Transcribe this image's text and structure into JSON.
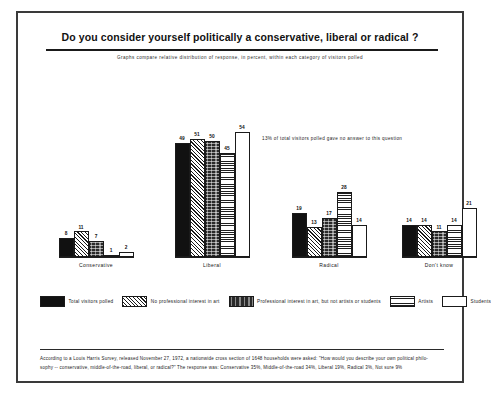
{
  "header": {
    "title": "Do you consider yourself politically a conservative, liberal or radical ?",
    "subtitle": "Graphs compare relative distribution of response, in percent, within each category of visitors polled"
  },
  "note": "13% of total visitors polled gave no answer to this question",
  "legend": {
    "items": [
      {
        "label": "Total visitors polled",
        "pattern": "solid",
        "color": "#111111"
      },
      {
        "label": "No professional interest in art",
        "pattern": "hatch",
        "color": "#ffffff"
      },
      {
        "label": "Professional interest in art, but not artists or students",
        "pattern": "stipple",
        "color": "#2a2a2a"
      },
      {
        "label": "Artists",
        "pattern": "grid",
        "color": "#ffffff"
      },
      {
        "label": "Students",
        "pattern": "white",
        "color": "#ffffff"
      }
    ]
  },
  "footer": {
    "line1": "According to a Louis Harris Survey, released November 27, 1972, a nationwide cross section of 1648 households were asked:  \"How would you describe your own political philo-",
    "line2": "sophy -- conservative, middle-of-the-road, liberal, or radical?\"     The response was:  Conservative 35%,   Middle-of-the-road 34%,   Liberal 19%,   Radical 3%,   Not sure 9%"
  },
  "chart_data": {
    "type": "bar",
    "title": "Do you consider yourself politically a conservative, liberal or radical ?",
    "subtitle": "Graphs compare relative distribution of response, in percent, within each category of visitors polled",
    "xlabel": "",
    "ylabel": "Percent",
    "ylim": [
      0,
      60
    ],
    "grid": false,
    "legend_position": "bottom",
    "categories": [
      "Conservative",
      "Liberal",
      "Radical",
      "Don't know"
    ],
    "series": [
      {
        "name": "Total visitors polled",
        "pattern": "solid",
        "values": [
          8,
          49,
          19,
          14
        ]
      },
      {
        "name": "No professional interest in art",
        "pattern": "hatch",
        "values": [
          11,
          51,
          13,
          14
        ]
      },
      {
        "name": "Professional interest in art, but not artists or students",
        "pattern": "stipple",
        "values": [
          7,
          50,
          17,
          11
        ]
      },
      {
        "name": "Artists",
        "pattern": "grid",
        "values": [
          1,
          45,
          28,
          14
        ]
      },
      {
        "name": "Students",
        "pattern": "white",
        "values": [
          2,
          54,
          14,
          21
        ]
      }
    ],
    "annotations": [
      "13% of total visitors polled gave no answer to this question"
    ]
  }
}
